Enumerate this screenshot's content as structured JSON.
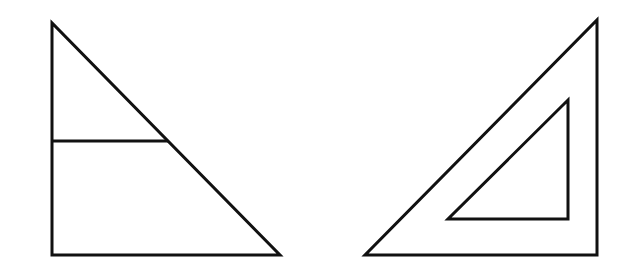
{
  "figure": {
    "width": 628,
    "height": 279,
    "background": "#ffffff",
    "stroke_color": "#111111",
    "stroke_width": 3,
    "shapes": {
      "left_triangle": {
        "points": "52,23 52,255 280,255",
        "divider": {
          "x1": 52,
          "y1": 141,
          "x2": 168,
          "y2": 141
        }
      },
      "right_triangle": {
        "outer_points": "597,20 597,255 365,255",
        "inner_points": "568,100 568,219 448,219"
      }
    }
  }
}
